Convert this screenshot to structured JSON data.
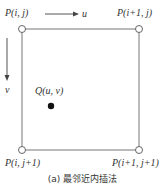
{
  "diagram": {
    "corners": {
      "top_left": "P(i, j)",
      "top_right": "P(i+1, j)",
      "bottom_left": "P(i, j+1)",
      "bottom_right": "P(i+1, j+1)"
    },
    "axes": {
      "horizontal": "u",
      "vertical": "v"
    },
    "point": "Q(u, v)",
    "caption": "(a) 最邻近内插法",
    "colors": {
      "line": "#666666",
      "dot": "#111111",
      "text": "#333333"
    }
  }
}
